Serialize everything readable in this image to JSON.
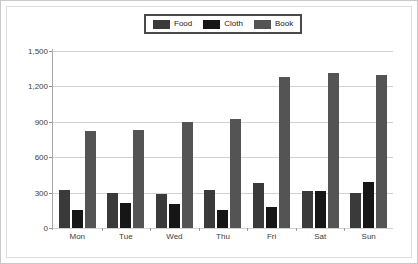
{
  "chart_data": {
    "type": "bar",
    "title": "",
    "xlabel": "",
    "ylabel": "",
    "categories": [
      "Mon",
      "Tue",
      "Wed",
      "Thu",
      "Fri",
      "Sat",
      "Sun"
    ],
    "series": [
      {
        "name": "Food",
        "color": "#3a3a3a",
        "values": [
          320,
          300,
          290,
          320,
          380,
          310,
          300
        ]
      },
      {
        "name": "Cloth",
        "color": "#161616",
        "values": [
          150,
          210,
          200,
          150,
          180,
          310,
          390
        ]
      },
      {
        "name": "Book",
        "color": "#545454",
        "values": [
          820,
          830,
          895,
          925,
          1280,
          1310,
          1300
        ]
      }
    ],
    "ylim": [
      0,
      1500
    ],
    "y_ticks": [
      "0",
      "300",
      "600",
      "900",
      "1,200",
      "1,500"
    ],
    "y_tick_values": [
      0,
      300,
      600,
      900,
      1200,
      1500
    ],
    "grid": true,
    "legend_position": "top-center"
  },
  "legend": {
    "items": [
      {
        "label": "Food"
      },
      {
        "label": "Cloth"
      },
      {
        "label": "Book"
      }
    ]
  }
}
